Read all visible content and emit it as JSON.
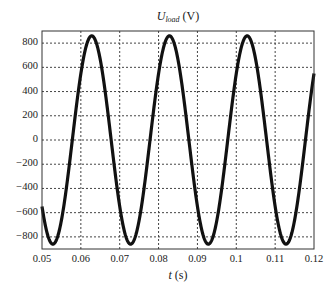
{
  "chart_data": {
    "type": "line",
    "title_parts": {
      "symbol": "U",
      "subscript": "load",
      "unit": "(V)"
    },
    "xlabel": "t (s)",
    "xlabel_parts": {
      "symbol": "t",
      "unit": "(s)"
    },
    "ylabel": "",
    "xlim": [
      0.05,
      0.12
    ],
    "ylim": [
      -900,
      900
    ],
    "grid": true,
    "grid_style": "dotted",
    "legend": null,
    "x_ticks": [
      0.05,
      0.06,
      0.07,
      0.08,
      0.09,
      0.1,
      0.11,
      0.12
    ],
    "x_tick_labels": [
      "0.05",
      "0.06",
      "0.07",
      "0.08",
      "0.09",
      "0.1",
      "0.11",
      "0.12"
    ],
    "y_ticks": [
      800,
      600,
      400,
      200,
      0,
      -200,
      -400,
      -600,
      -800
    ],
    "y_tick_labels": [
      "800",
      "600",
      "400",
      "200",
      "0",
      "−200",
      "−400",
      "−600",
      "−800"
    ],
    "series": [
      {
        "name": "U_load",
        "color": "#111111",
        "description": "Sinusoidal load voltage, ~50 Hz, amplitude ~860 V",
        "frequency_hz": 50,
        "amplitude": 860,
        "zero_crossing_rising_t": 0.0578,
        "peaks": [
          {
            "t": 0.0628,
            "v": 860
          },
          {
            "t": 0.0828,
            "v": 860
          },
          {
            "t": 0.1028,
            "v": 860
          }
        ],
        "troughs": [
          {
            "t": 0.0528,
            "v": -860
          },
          {
            "t": 0.0728,
            "v": -860
          },
          {
            "t": 0.0928,
            "v": -860
          },
          {
            "t": 0.1128,
            "v": -860
          }
        ],
        "x": [
          0.05,
          0.0528,
          0.0553,
          0.0578,
          0.0603,
          0.0628,
          0.0653,
          0.0678,
          0.0703,
          0.0728,
          0.0753,
          0.0778,
          0.0803,
          0.0828,
          0.0853,
          0.0878,
          0.0903,
          0.0928,
          0.0953,
          0.0978,
          0.1003,
          0.1028,
          0.1053,
          0.1078,
          0.1103,
          0.1128,
          0.1153,
          0.1178,
          0.12
        ],
        "y": [
          -549,
          -860,
          -608,
          0,
          608,
          860,
          608,
          0,
          -608,
          -860,
          -608,
          0,
          608,
          860,
          608,
          0,
          -608,
          -860,
          -608,
          0,
          608,
          860,
          608,
          0,
          -608,
          -860,
          -608,
          0,
          548
        ]
      }
    ]
  }
}
